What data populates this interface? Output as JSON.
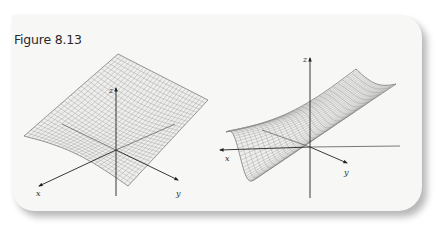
{
  "figure": {
    "caption": "Figure 8.13",
    "colors": {
      "card_background": "#f7f7f6",
      "mesh": "#8a8a8a",
      "outline": "#6a6a6a",
      "axis": "#222222"
    }
  },
  "panels": [
    {
      "id": "left",
      "axes": {
        "origin": [
          116,
          150
        ],
        "x": {
          "label": "x",
          "end": [
            39,
            186
          ],
          "label_pos": [
            36,
            196
          ],
          "back": [
            175,
            124
          ]
        },
        "y": {
          "label": "y",
          "end": [
            178,
            180
          ],
          "label_pos": [
            176,
            196
          ],
          "back": [
            62,
            124
          ]
        },
        "z": {
          "label": "z",
          "end": [
            116,
            88
          ],
          "label_pos": [
            109,
            93
          ],
          "bottom": [
            116,
            196
          ]
        }
      },
      "surface": {
        "corners": [
          [
            24,
            136
          ],
          [
            118,
            54
          ],
          [
            208,
            100
          ],
          [
            128,
            186
          ]
        ],
        "description": "saddle-shaped wireframe surface rising toward back corners"
      }
    },
    {
      "id": "right",
      "axes": {
        "origin": [
          310,
          147
        ],
        "x": {
          "label": "x",
          "end": [
            220,
            150
          ],
          "label_pos": [
            225,
            161
          ],
          "back": [
            400,
            146
          ]
        },
        "y": {
          "label": "y",
          "end": [
            347,
            163
          ],
          "label_pos": [
            344,
            175
          ],
          "back": [
            262,
            130
          ]
        },
        "z": {
          "label": "z",
          "end": [
            310,
            58
          ],
          "label_pos": [
            303,
            62
          ],
          "bottom": [
            310,
            198
          ]
        }
      },
      "surface": {
        "corners": [
          [
            226,
            132
          ],
          [
            356,
            69
          ],
          [
            396,
            84
          ],
          [
            254,
            180
          ]
        ],
        "description": "monkey-saddle style wireframe surface with wavy edges"
      }
    }
  ]
}
